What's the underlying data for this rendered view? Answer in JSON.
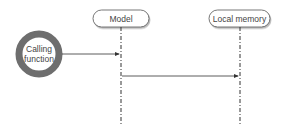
{
  "diagram": {
    "type": "sequence",
    "actor": {
      "label_line1": "Calling",
      "label_line2": "function"
    },
    "participants": [
      {
        "label": "Model"
      },
      {
        "label": "Local memory"
      }
    ],
    "messages": [
      {
        "from": "Calling function",
        "to": "Model"
      },
      {
        "from": "Model",
        "to": "Local memory"
      }
    ],
    "colors": {
      "ring": "#6e6e6e",
      "line": "#333333",
      "box_border": "#555555",
      "text": "#444444"
    }
  }
}
